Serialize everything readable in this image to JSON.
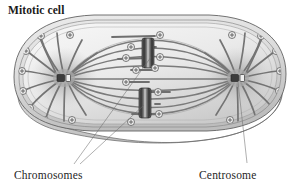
{
  "figure": {
    "title": "Mitotic cell",
    "background_color": "#ffffff",
    "type": "biological-diagram",
    "view": "three-dimensional cutaway, oval flattened cell seen from above"
  },
  "labels": {
    "chromosomes": "Chromosomes",
    "centrosome": "Centrosome"
  },
  "colors": {
    "outline": "#5f5f5f",
    "membrane_rim": "#d9d9d9",
    "cytoplasm_light": "#f2f2f2",
    "cytoplasm_mid": "#e0e0e0",
    "cytoplasm_shadow": "#c9c9c9",
    "side_wall": "#d2d2d2",
    "spindle_fiber": "#7a7a7a",
    "spindle_fiber_dark": "#555555",
    "chromosome_body": "#4a4a4a",
    "chromosome_highlight": "#a8a8a8",
    "centrosome_halo": "#b5b5b5",
    "centriole": "#3a3a3a",
    "plus_marker": "#5a5a5a",
    "leader_line": "#6e6e6e",
    "title_text": "#1a1a1a",
    "label_text": "#262626"
  },
  "structures": {
    "cell": {
      "name": "cell",
      "shape": "rounded oblong / lozenge with visible depth",
      "has_side_wall": true
    },
    "centrosomes": [
      {
        "id": "left",
        "name": "centrosome-left",
        "cx": 64,
        "cy": 78,
        "centriole_pair": true
      },
      {
        "id": "right",
        "name": "centrosome-right",
        "cx": 238,
        "cy": 78,
        "centriole_pair": true
      }
    ],
    "chromosomes": [
      {
        "id": "upper",
        "name": "chromosome-upper",
        "cx": 148,
        "cy": 55,
        "orientation": "vertical"
      },
      {
        "id": "lower",
        "name": "chromosome-lower",
        "cx": 145,
        "cy": 104,
        "orientation": "vertical"
      }
    ],
    "plus_end_markers": {
      "glyph": "circled-plus",
      "meaning": "microtubule plus end",
      "count": 26
    },
    "spindle_fibers": {
      "polar_arcs": 10,
      "astral_rays_per_pole": 12,
      "kinetochore_fibers": 8
    }
  }
}
